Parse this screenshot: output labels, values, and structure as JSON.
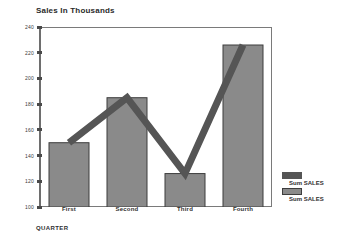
{
  "chart_data": {
    "type": "bar",
    "title": "Sales In Thousands",
    "xlabel": "QUARTER",
    "ylabel": "",
    "categories": [
      "First",
      "Second",
      "Third",
      "Fourth"
    ],
    "ylim": [
      100,
      240
    ],
    "yticks": [
      100,
      120,
      140,
      160,
      180,
      200,
      220,
      240
    ],
    "ytick_labels": [
      "100",
      "120",
      "140",
      "160",
      "180",
      "200",
      "220",
      "240"
    ],
    "grid": false,
    "legend_position": "right",
    "series": [
      {
        "name": "Sum SALES",
        "type": "bar",
        "values": [
          150,
          185,
          126,
          226
        ],
        "color": "#8a8a8a",
        "edge_color": "#3d3d3d"
      },
      {
        "name": "Sum SALES",
        "type": "line",
        "values": [
          150,
          185,
          126,
          226
        ],
        "color": "#555555"
      }
    ]
  },
  "legend": {
    "entries": [
      {
        "label": "Sum SALES",
        "swatch": "line-swatch"
      },
      {
        "label": "Sum SALES",
        "swatch": "bar-swatch"
      }
    ]
  },
  "colors": {
    "bar_fill": "#8a8a8a",
    "bar_edge": "#3d3d3d",
    "line": "#555555",
    "axis": "#6e6e6e",
    "text": "#2f2f2f",
    "background": "#ffffff"
  }
}
